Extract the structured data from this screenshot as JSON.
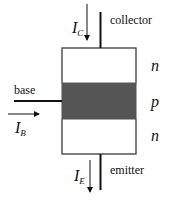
{
  "diagram": {
    "terminals": {
      "collector": "collector",
      "base": "base",
      "emitter": "emitter"
    },
    "layers": [
      {
        "label": "n",
        "color": "#ffffff"
      },
      {
        "label": "p",
        "color": "#555555"
      },
      {
        "label": "n",
        "color": "#ffffff"
      }
    ],
    "currents": {
      "collector": {
        "symbol": "I",
        "sub": "C"
      },
      "base": {
        "symbol": "I",
        "sub": "B"
      },
      "emitter": {
        "symbol": "I",
        "sub": "E"
      }
    }
  }
}
